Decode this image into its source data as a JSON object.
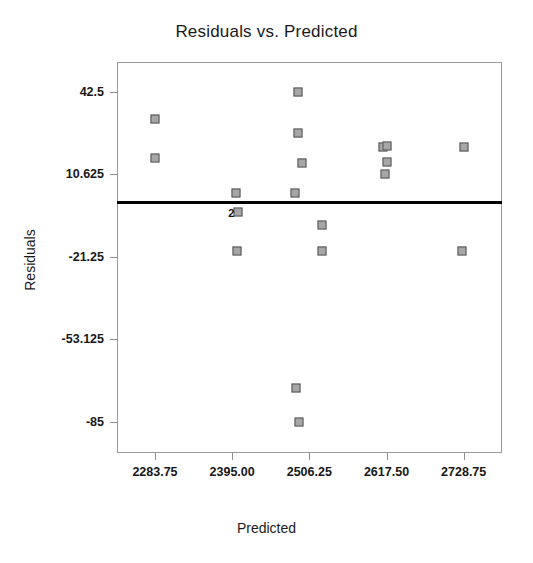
{
  "chart_data": {
    "type": "scatter",
    "title": "Residuals vs. Predicted",
    "xlabel": "Predicted",
    "ylabel": "Residuals",
    "grid": false,
    "legend": false,
    "xlim": [
      2229.0,
      2784.0
    ],
    "ylim": [
      -97.0,
      54.0
    ],
    "xticks": [
      2283.75,
      2395.0,
      2506.25,
      2617.5,
      2728.75
    ],
    "xtick_labels": [
      "2283.75",
      "2395.00",
      "2506.25",
      "2617.50",
      "2728.75"
    ],
    "yticks": [
      42.5,
      10.625,
      -21.25,
      -53.125,
      -85
    ],
    "ytick_labels": [
      "42.5",
      "10.625",
      "-21.25",
      "-53.125",
      "-85"
    ],
    "reference_line": {
      "orientation": "horizontal",
      "y": 0,
      "color": "#000000",
      "width": 3
    },
    "marker": {
      "shape": "square",
      "size": 9,
      "fill": "#b9b9b9",
      "edge": "#4d4d4d"
    },
    "points": [
      {
        "x": 2283.75,
        "y": 32.0,
        "label": ""
      },
      {
        "x": 2283.75,
        "y": 17.0,
        "label": ""
      },
      {
        "x": 2401.0,
        "y": 3.5,
        "label": ""
      },
      {
        "x": 2404.0,
        "y": -4.0,
        "label": "2"
      },
      {
        "x": 2402.0,
        "y": -19.0,
        "label": ""
      },
      {
        "x": 2490.0,
        "y": 42.5,
        "label": ""
      },
      {
        "x": 2490.0,
        "y": 26.5,
        "label": ""
      },
      {
        "x": 2496.0,
        "y": 15.0,
        "label": ""
      },
      {
        "x": 2486.0,
        "y": 3.5,
        "label": ""
      },
      {
        "x": 2487.0,
        "y": -72.0,
        "label": ""
      },
      {
        "x": 2492.0,
        "y": -85.0,
        "label": ""
      },
      {
        "x": 2524.0,
        "y": -9.0,
        "label": ""
      },
      {
        "x": 2524.0,
        "y": -19.0,
        "label": ""
      },
      {
        "x": 2613.0,
        "y": 21.0,
        "label": ""
      },
      {
        "x": 2617.5,
        "y": 21.5,
        "label": ""
      },
      {
        "x": 2617.5,
        "y": 15.5,
        "label": ""
      },
      {
        "x": 2615.0,
        "y": 10.625,
        "label": ""
      },
      {
        "x": 2728.75,
        "y": 21.0,
        "label": ""
      },
      {
        "x": 2727.0,
        "y": -19.0,
        "label": ""
      }
    ],
    "overlap_annotations": [
      {
        "text": "2",
        "x": 2404.0,
        "y": -4.0
      }
    ]
  }
}
